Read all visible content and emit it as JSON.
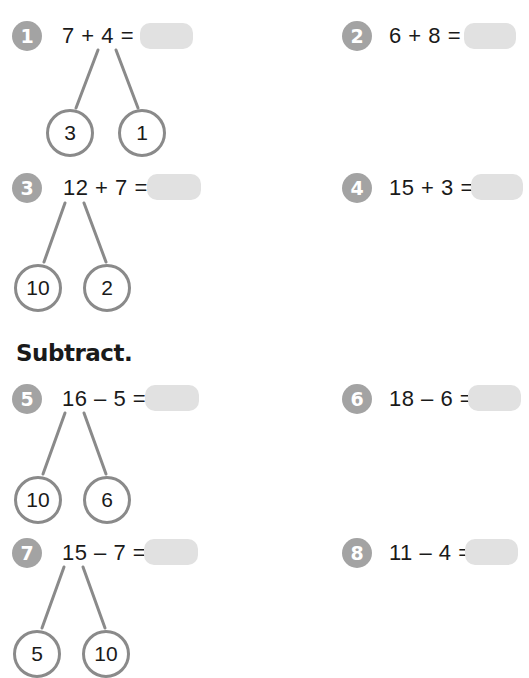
{
  "section_heading": "Subtract.",
  "colors": {
    "badge": "#a3a3a3",
    "answer_box": "#e1e1e1",
    "bond_line": "#8a8a8a"
  },
  "problems": [
    {
      "number": "1",
      "equation": "7 + 4 =",
      "answer": "",
      "bond": [
        "3",
        "1"
      ]
    },
    {
      "number": "2",
      "equation": "6 + 8 =",
      "answer": ""
    },
    {
      "number": "3",
      "equation": "12 + 7 =",
      "answer": "",
      "bond": [
        "10",
        "2"
      ]
    },
    {
      "number": "4",
      "equation": "15 + 3 =",
      "answer": ""
    },
    {
      "number": "5",
      "equation": "16 – 5 =",
      "answer": "",
      "bond": [
        "10",
        "6"
      ]
    },
    {
      "number": "6",
      "equation": "18 – 6 =",
      "answer": ""
    },
    {
      "number": "7",
      "equation": "15 – 7 =",
      "answer": "",
      "bond": [
        "5",
        "10"
      ]
    },
    {
      "number": "8",
      "equation": "11 – 4 =",
      "answer": ""
    }
  ]
}
